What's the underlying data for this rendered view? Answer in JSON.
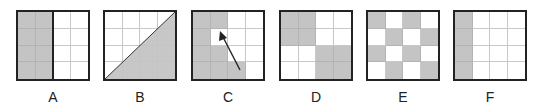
{
  "figures": [
    {
      "label": "A",
      "cells": [
        "g",
        "g",
        "w",
        "w",
        "g",
        "g",
        "w",
        "w",
        "g",
        "g",
        "w",
        "w",
        "g",
        "g",
        "w",
        "w"
      ],
      "extra": "vertical-divider-half"
    },
    {
      "label": "B",
      "cells": [
        "w",
        "w",
        "w",
        "w",
        "w",
        "w",
        "w",
        "w",
        "w",
        "w",
        "w",
        "w",
        "w",
        "w",
        "w",
        "w"
      ],
      "extra": "diagonal-lower-right-shaded"
    },
    {
      "label": "C",
      "cells": [
        "g",
        "g",
        "w",
        "w",
        "g",
        "w",
        "w",
        "w",
        "g",
        "g",
        "w",
        "w",
        "g",
        "g",
        "g",
        "w"
      ],
      "extra": "arrow-from-bottom-to-row2-col2"
    },
    {
      "label": "D",
      "cells": [
        "g",
        "g",
        "w",
        "w",
        "g",
        "g",
        "w",
        "w",
        "w",
        "w",
        "g",
        "g",
        "w",
        "w",
        "g",
        "g"
      ],
      "extra": ""
    },
    {
      "label": "E",
      "cells": [
        "g",
        "w",
        "g",
        "w",
        "w",
        "g",
        "w",
        "g",
        "g",
        "w",
        "g",
        "w",
        "w",
        "g",
        "w",
        "g"
      ],
      "extra": ""
    },
    {
      "label": "F",
      "cells": [
        "g",
        "w",
        "w",
        "w",
        "g",
        "w",
        "w",
        "w",
        "g",
        "w",
        "w",
        "w",
        "g",
        "w",
        "w",
        "w"
      ],
      "extra": ""
    }
  ],
  "colors": {
    "shade": "#c4c4c4",
    "border": "#222222",
    "gridline": "#c8c8c8"
  }
}
